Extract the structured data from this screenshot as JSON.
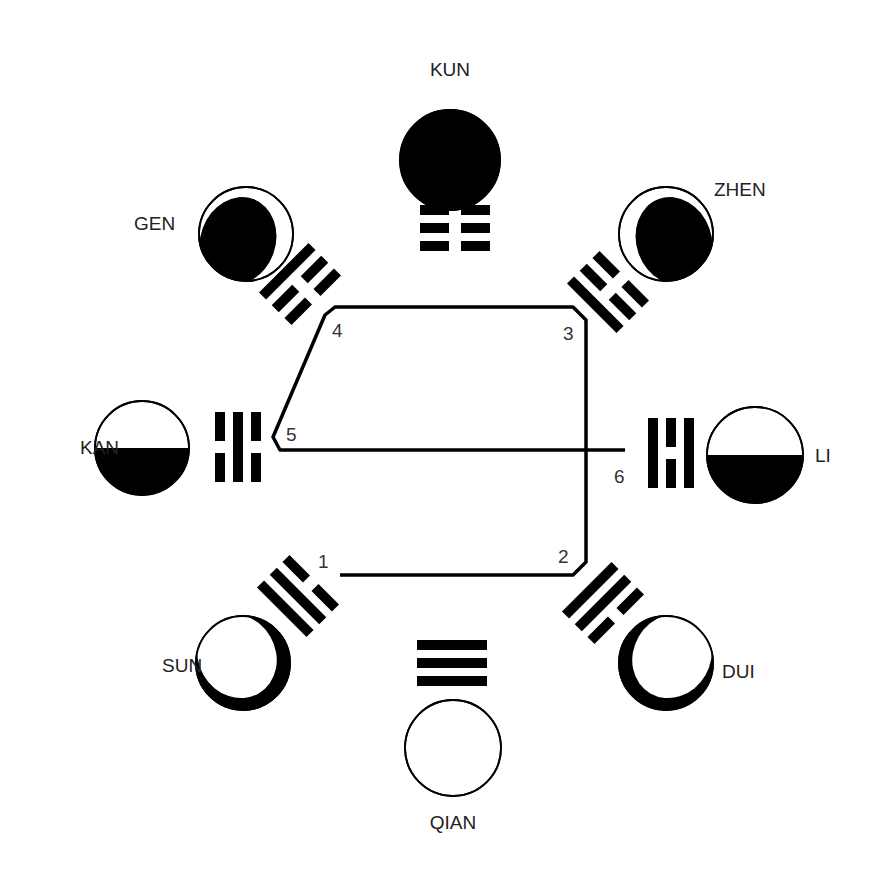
{
  "diagram": {
    "colors": {
      "ink": "#000000",
      "paper": "#ffffff",
      "text": "#222222"
    },
    "trigrams": [
      {
        "name": "KUN",
        "lines_inner_to_outer": [
          "broken",
          "broken",
          "broken"
        ],
        "moon": {
          "cx": 450,
          "cy": 160,
          "r": 50,
          "phase": "new",
          "shade": "full"
        },
        "label": {
          "text": "KUN",
          "x": 450,
          "y": 76,
          "anchor": "middle"
        },
        "trigram": {
          "cx": 455,
          "cy": 228,
          "angle": 0
        }
      },
      {
        "name": "ZHEN",
        "lines_inner_to_outer": [
          "solid",
          "broken",
          "broken"
        ],
        "moon": {
          "cx": 666,
          "cy": 234,
          "r": 47,
          "phase": "waxing-gibbous-dark",
          "shade": "gibbous-right-dark"
        },
        "label": {
          "text": "ZHEN",
          "x": 714,
          "y": 196,
          "anchor": "start"
        },
        "trigram": {
          "cx": 608,
          "cy": 292,
          "angle": 45
        }
      },
      {
        "name": "LI",
        "lines_inner_to_outer": [
          "solid",
          "broken",
          "solid"
        ],
        "moon": {
          "cx": 755,
          "cy": 455,
          "r": 48,
          "phase": "half",
          "shade": "bottom-half"
        },
        "label": {
          "text": "LI",
          "x": 815,
          "y": 462,
          "anchor": "start"
        },
        "trigram": {
          "cx": 671,
          "cy": 453,
          "angle": 90
        }
      },
      {
        "name": "DUI",
        "lines_inner_to_outer": [
          "solid",
          "solid",
          "broken"
        ],
        "moon": {
          "cx": 666,
          "cy": 663,
          "r": 47,
          "phase": "crescent",
          "shade": "crescent-bottom-left"
        },
        "label": {
          "text": "DUI",
          "x": 722,
          "y": 678,
          "anchor": "start"
        },
        "trigram": {
          "cx": 603,
          "cy": 603,
          "angle": 135
        }
      },
      {
        "name": "QIAN",
        "lines_inner_to_outer": [
          "solid",
          "solid",
          "solid"
        ],
        "moon": {
          "cx": 453,
          "cy": 748,
          "r": 48,
          "phase": "full",
          "shade": "none"
        },
        "label": {
          "text": "QIAN",
          "x": 453,
          "y": 829,
          "anchor": "middle"
        },
        "trigram": {
          "cx": 452,
          "cy": 663,
          "angle": 180
        }
      },
      {
        "name": "SUN",
        "lines_inner_to_outer": [
          "broken",
          "solid",
          "solid"
        ],
        "moon": {
          "cx": 243,
          "cy": 663,
          "r": 47,
          "phase": "crescent",
          "shade": "crescent-bottom-right"
        },
        "label": {
          "text": "SUN",
          "x": 162,
          "y": 672,
          "anchor": "start"
        },
        "trigram": {
          "cx": 298,
          "cy": 596,
          "angle": 225
        }
      },
      {
        "name": "KAN",
        "lines_inner_to_outer": [
          "broken",
          "solid",
          "broken"
        ],
        "moon": {
          "cx": 142,
          "cy": 448,
          "r": 47,
          "phase": "half",
          "shade": "bottom-half"
        },
        "label": {
          "text": "KAN",
          "x": 80,
          "y": 454,
          "anchor": "start"
        },
        "trigram": {
          "cx": 238,
          "cy": 447,
          "angle": 270
        }
      },
      {
        "name": "GEN",
        "lines_inner_to_outer": [
          "broken",
          "broken",
          "solid"
        ],
        "moon": {
          "cx": 246,
          "cy": 234,
          "r": 47,
          "phase": "waning-gibbous-dark",
          "shade": "gibbous-left-dark"
        },
        "label": {
          "text": "GEN",
          "x": 134,
          "y": 230,
          "anchor": "start"
        },
        "trigram": {
          "cx": 300,
          "cy": 284,
          "angle": 315
        }
      }
    ],
    "path": {
      "points": [
        [
          340,
          575
        ],
        [
          573,
          575
        ],
        [
          586,
          562
        ],
        [
          586,
          320
        ],
        [
          573,
          307
        ],
        [
          335,
          307
        ],
        [
          325,
          315
        ],
        [
          273,
          437
        ],
        [
          280,
          450
        ],
        [
          625,
          450
        ]
      ],
      "stroke_width": 3.5
    },
    "markers": [
      {
        "n": "1",
        "x": 318,
        "y": 568
      },
      {
        "n": "2",
        "x": 558,
        "y": 563
      },
      {
        "n": "3",
        "x": 563,
        "y": 340
      },
      {
        "n": "4",
        "x": 332,
        "y": 337
      },
      {
        "n": "5",
        "x": 286,
        "y": 441
      },
      {
        "n": "6",
        "x": 614,
        "y": 483
      }
    ]
  }
}
